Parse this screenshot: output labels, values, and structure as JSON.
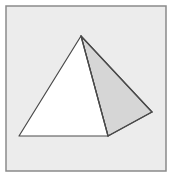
{
  "figure": {
    "colors": {
      "page_background": "#ffffff",
      "panel_fill": "#ececec",
      "panel_border": "#8a8a8a",
      "front_face_fill": "#ffffff",
      "side_face_fill": "#d6d6d6",
      "edge_stroke": "#4a4a4a"
    },
    "faces": [
      {
        "name": "front-face",
        "shaded": false
      },
      {
        "name": "side-face",
        "shaded": true
      }
    ]
  }
}
